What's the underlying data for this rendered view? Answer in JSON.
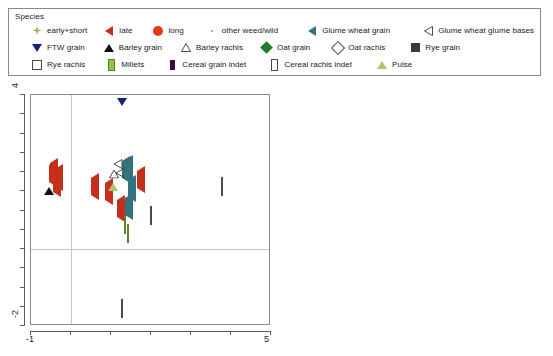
{
  "legend": {
    "title": "Species",
    "rows": [
      [
        {
          "label": "early+short",
          "icon": "diamond4-olive-icon",
          "shape": "m-diamond4",
          "color": "#a3b05a"
        },
        {
          "label": "late",
          "icon": "triangle-left-red-icon",
          "shape": "m-tri-left",
          "color": "#c4301c"
        },
        {
          "label": "long",
          "icon": "circle-red-icon",
          "shape": "m-circle",
          "color": "#e8361a"
        },
        {
          "label": "other weed/wild",
          "icon": "dot-gray-icon",
          "shape": "m-dot",
          "color": "#9a9a9a"
        },
        {
          "label": "Glume wheat grain",
          "icon": "triangle-left-teal-icon",
          "shape": "m-tri-left-teal",
          "color": "#33737d"
        },
        {
          "label": "Glume wheat glume bases",
          "icon": "triangle-left-open-icon",
          "shape": "m-tri-left-open",
          "color": "#4a4a4a"
        }
      ],
      [
        {
          "label": "FTW grain",
          "icon": "triangle-down-navy-icon",
          "shape": "m-tri-down",
          "color": "#17207a"
        },
        {
          "label": "Barley grain",
          "icon": "triangle-up-black-icon",
          "shape": "m-tri-up",
          "color": "#101010"
        },
        {
          "label": "Barley rachis",
          "icon": "triangle-up-open-icon",
          "shape": "m-tri-up-open",
          "color": "#4a4a4a"
        },
        {
          "label": "Oat grain",
          "icon": "diamond-green-icon",
          "shape": "m-diamond-green",
          "color": "#1f7a2e"
        },
        {
          "label": "Oat rachis",
          "icon": "diamond-open-icon",
          "shape": "m-diamond-open",
          "color": "#4a4a4a"
        },
        {
          "label": "Rye grain",
          "icon": "square-dark-icon",
          "shape": "m-square-dark",
          "color": "#3a3a3a"
        }
      ],
      [
        {
          "label": "Rye rachis",
          "icon": "square-open-icon",
          "shape": "m-square-open",
          "color": "#4a4a4a"
        },
        {
          "label": "Millets",
          "icon": "bar-green-icon",
          "shape": "m-bar-green",
          "color": "#8cc63e"
        },
        {
          "label": "Cereal grain indet",
          "icon": "bar-purple-icon",
          "shape": "m-bar-purple",
          "color": "#3b0b33"
        },
        {
          "label": "Cereal rachis indet",
          "icon": "bar-open-icon",
          "shape": "m-bar-open",
          "color": "#4a4a4a"
        },
        {
          "label": "Pulse",
          "icon": "triangle-up-lightgreen-icon",
          "shape": "m-tri-up-pulse",
          "color": "#a8c96a"
        }
      ]
    ]
  },
  "axes": {
    "x_min_label": "-1",
    "x_max_label": "5",
    "y_min_label": "-2",
    "y_max_label": "4"
  },
  "chart_data": {
    "type": "scatter",
    "title": "",
    "xlabel": "",
    "ylabel": "",
    "xlim": [
      -1,
      5
    ],
    "ylim": [
      -2,
      4
    ],
    "grid": "reference lines at x=0 and y=0",
    "legend_position": "top",
    "series": [
      {
        "name": "early+short",
        "marker": "m-diamond4",
        "color": "#a3b05a",
        "points": [
          [
            1.25,
            2.05
          ],
          [
            1.62,
            2.05
          ],
          [
            0.95,
            1.93
          ],
          [
            1.52,
            1.4
          ],
          [
            1.25,
            1.32
          ],
          [
            1.08,
            1.22
          ],
          [
            1.62,
            1.47
          ],
          [
            1.42,
            1.05
          ],
          [
            1.15,
            0.95
          ],
          [
            1.35,
            0.63
          ],
          [
            1.2,
            0.38
          ],
          [
            0.87,
            0.22
          ],
          [
            1.12,
            0.2
          ],
          [
            1.18,
            -0.07
          ],
          [
            0.74,
            0.02
          ],
          [
            1.3,
            1.18
          ],
          [
            1.48,
            0.82
          ]
        ]
      },
      {
        "name": "late",
        "marker": "m-tri-left",
        "color": "#c4301c",
        "points": [
          [
            -0.45,
            1.95
          ],
          [
            -0.35,
            1.7
          ],
          [
            -0.3,
            1.85
          ],
          [
            0.6,
            1.62
          ],
          [
            1.75,
            1.78
          ],
          [
            0.95,
            1.48
          ],
          [
            -0.42,
            2.0
          ],
          [
            1.25,
            1.05
          ]
        ]
      },
      {
        "name": "long",
        "marker": "m-circle",
        "color": "#e8361a",
        "points": [
          [
            -0.22,
            2.18
          ],
          [
            0.05,
            2.22
          ],
          [
            0.72,
            1.95
          ],
          [
            -0.18,
            1.62
          ],
          [
            -0.48,
            1.92
          ]
        ]
      },
      {
        "name": "other weed/wild",
        "marker": "m-dot",
        "color": "#9a9a9a",
        "points": [
          [
            1.35,
            2.35
          ],
          [
            2.15,
            2.05
          ],
          [
            2.35,
            1.5
          ],
          [
            2.1,
            1.15
          ],
          [
            1.72,
            0.95
          ],
          [
            1.02,
            1.38
          ],
          [
            0.92,
            0.78
          ],
          [
            1.55,
            0.55
          ],
          [
            1.45,
            0.25
          ],
          [
            1.68,
            0.3
          ],
          [
            0.82,
            0.42
          ],
          [
            1.22,
            0.08
          ],
          [
            1.7,
            0.02
          ],
          [
            2.05,
            0.42
          ],
          [
            1.38,
            -0.25
          ],
          [
            1.02,
            -0.18
          ],
          [
            0.62,
            -0.32
          ],
          [
            1.92,
            -0.05
          ],
          [
            1.48,
            -0.48
          ],
          [
            1.05,
            0.55
          ],
          [
            0.55,
            1.0
          ],
          [
            2.28,
            1.82
          ],
          [
            1.88,
            1.25
          ],
          [
            1.58,
            -0.05
          ],
          [
            1.28,
            0.45
          ],
          [
            0.98,
            0.12
          ]
        ]
      },
      {
        "name": "Glume wheat grain",
        "marker": "m-tri-left-teal",
        "color": "#33737d",
        "points": [
          [
            1.45,
            2.08
          ],
          [
            1.38,
            2.06
          ],
          [
            1.52,
            1.55
          ],
          [
            1.45,
            1.08
          ]
        ]
      },
      {
        "name": "Glume wheat glume bases",
        "marker": "m-tri-left-open",
        "color": "#4a4a4a",
        "points": [
          [
            1.22,
            1.98
          ],
          [
            1.18,
            2.22
          ]
        ]
      },
      {
        "name": "FTW grain",
        "marker": "m-tri-down",
        "color": "#17207a",
        "points": [
          [
            1.28,
            3.48
          ]
        ]
      },
      {
        "name": "Barley grain",
        "marker": "m-tri-up",
        "color": "#101010",
        "points": [
          [
            -0.55,
            1.82
          ]
        ]
      },
      {
        "name": "Barley rachis",
        "marker": "m-tri-up-open",
        "color": "#4a4a4a",
        "points": [
          [
            1.08,
            1.95
          ]
        ]
      },
      {
        "name": "Oat grain",
        "marker": "m-diamond-green",
        "color": "#1f7a2e",
        "points": [
          [
            -0.42,
            2.18
          ],
          [
            -0.52,
            1.88
          ]
        ]
      },
      {
        "name": "Oat rachis",
        "marker": "m-diamond-open",
        "color": "#4a4a4a",
        "points": [
          [
            2.0,
            0.85
          ]
        ]
      },
      {
        "name": "Rye grain",
        "marker": "m-square-dark",
        "color": "#3a3a3a",
        "points": [
          [
            3.28,
            1.62
          ]
        ]
      },
      {
        "name": "Rye rachis",
        "marker": "m-square-open",
        "color": "#4a4a4a",
        "points": [
          [
            3.78,
            1.62
          ]
        ]
      },
      {
        "name": "Millets",
        "marker": "m-bar-green",
        "color": "#8cc63e",
        "points": [
          [
            1.35,
            0.62
          ],
          [
            1.42,
            0.38
          ]
        ]
      },
      {
        "name": "Cereal grain indet",
        "marker": "m-bar-purple",
        "color": "#3b0b33",
        "points": [
          [
            1.45,
            1.7
          ]
        ]
      },
      {
        "name": "Cereal rachis indet",
        "marker": "m-bar-open",
        "color": "#4a4a4a",
        "points": [
          [
            1.28,
            -1.55
          ]
        ]
      },
      {
        "name": "Pulse",
        "marker": "m-tri-up-pulse",
        "color": "#a8c96a",
        "points": [
          [
            1.05,
            1.92
          ]
        ]
      }
    ]
  }
}
